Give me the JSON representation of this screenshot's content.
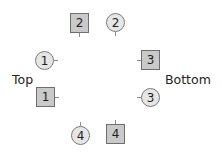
{
  "labels": {
    "left": "Top",
    "right": "Bottom"
  },
  "nodes": [
    {
      "id": "square-2",
      "shape": "square",
      "text": "2"
    },
    {
      "id": "circle-2",
      "shape": "circle",
      "text": "2"
    },
    {
      "id": "circle-1",
      "shape": "circle",
      "text": "1"
    },
    {
      "id": "square-1",
      "shape": "square",
      "text": "1"
    },
    {
      "id": "square-3",
      "shape": "square",
      "text": "3"
    },
    {
      "id": "circle-3",
      "shape": "circle",
      "text": "3"
    },
    {
      "id": "circle-4",
      "shape": "circle",
      "text": "4"
    },
    {
      "id": "square-4",
      "shape": "square",
      "text": "4"
    }
  ],
  "colors": {
    "square_fill": "#c9c9c9",
    "square_border": "#6e6e6e",
    "circle_fill": "#e6e6e6",
    "circle_border": "#7a7a7a"
  }
}
